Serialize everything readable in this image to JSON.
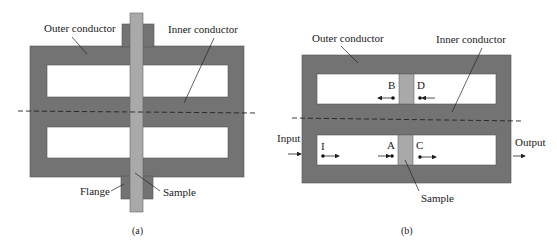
{
  "figure_a": {
    "caption": "(a)",
    "labels": {
      "outer_conductor": "Outer conductor",
      "inner_conductor": "Inner conductor",
      "flange": "Flange",
      "sample": "Sample"
    }
  },
  "figure_b": {
    "caption": "(b)",
    "labels": {
      "outer_conductor": "Outer conductor",
      "inner_conductor": "Inner conductor",
      "input": "Input",
      "output": "Output",
      "sample": "Sample"
    },
    "points": {
      "I": "I",
      "A": "A",
      "B": "B",
      "C": "C",
      "D": "D"
    }
  },
  "colors": {
    "conductor": "#737373",
    "sample": "#a9a9a9",
    "cavity": "#ffffff",
    "line": "#222222"
  }
}
